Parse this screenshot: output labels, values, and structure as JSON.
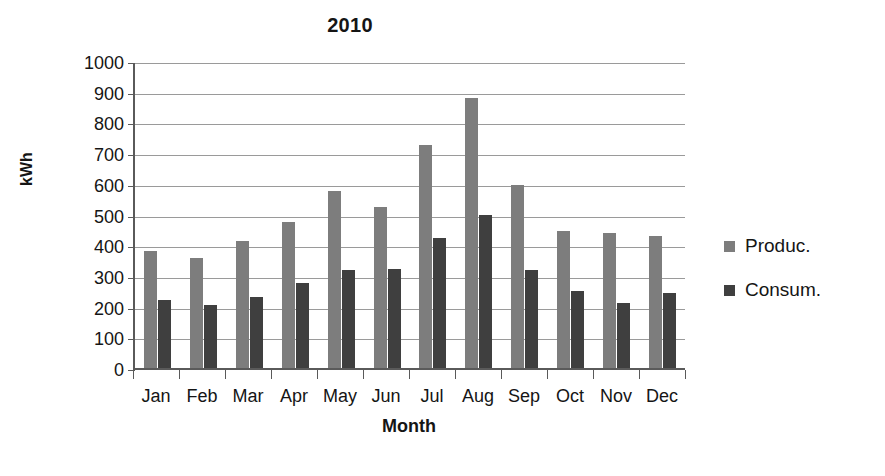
{
  "chart_data": {
    "type": "bar",
    "title": "2010",
    "xlabel": "Month",
    "ylabel": "kWh",
    "ylim": [
      0,
      1000
    ],
    "ytick_step": 100,
    "yticks": [
      "1000",
      "900",
      "800",
      "700",
      "600",
      "500",
      "400",
      "300",
      "200",
      "100",
      "0"
    ],
    "ytick_values": [
      1000,
      900,
      800,
      700,
      600,
      500,
      400,
      300,
      200,
      100,
      0
    ],
    "grid": true,
    "legend_position": "right",
    "categories": [
      "Jan",
      "Feb",
      "Mar",
      "Apr",
      "May",
      "Jun",
      "Jul",
      "Aug",
      "Sep",
      "Oct",
      "Nov",
      "Dec"
    ],
    "series": [
      {
        "name": "Produc.",
        "color": "#7d7d7d",
        "values": [
          381,
          358,
          413,
          475,
          578,
          525,
          727,
          880,
          595,
          445,
          440,
          430
        ]
      },
      {
        "name": "Consum.",
        "color": "#3f3f3f",
        "values": [
          222,
          205,
          230,
          278,
          320,
          323,
          425,
          500,
          320,
          250,
          212,
          243
        ]
      }
    ]
  },
  "legend": {
    "items": [
      {
        "label": "Produc.",
        "color": "#7d7d7d",
        "swatch_icon": "square-swatch-icon"
      },
      {
        "label": "Consum.",
        "color": "#3f3f3f",
        "swatch_icon": "square-swatch-icon"
      }
    ]
  }
}
